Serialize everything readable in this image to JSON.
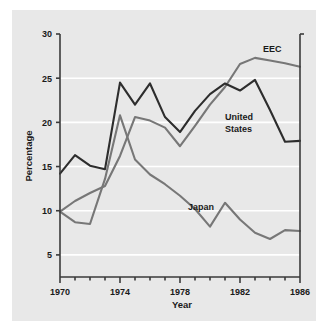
{
  "chart_data": {
    "type": "line",
    "title": "",
    "xlabel": "Year",
    "ylabel": "Percentage",
    "xlim": [
      1970,
      1986
    ],
    "ylim": [
      2.5,
      30
    ],
    "grid": true,
    "grid_values": [
      5,
      10,
      15,
      20,
      25
    ],
    "legend_position": "inline-annotations",
    "x": [
      1970,
      1971,
      1972,
      1973,
      1974,
      1975,
      1976,
      1977,
      1978,
      1979,
      1980,
      1981,
      1982,
      1983,
      1984,
      1985,
      1986
    ],
    "xticks_major": [
      "1970",
      "1974",
      "1978",
      "1982",
      "1986"
    ],
    "xticks_major_values": [
      1970,
      1974,
      1978,
      1982,
      1986
    ],
    "yticks": [
      "5",
      "10",
      "15",
      "20",
      "25",
      "30"
    ],
    "ytick_values": [
      5,
      10,
      15,
      20,
      25,
      30
    ],
    "series": [
      {
        "name": "EEC",
        "color": "#777777",
        "label": "EEC",
        "values": [
          9.9,
          11.1,
          12.0,
          12.8,
          16.2,
          20.6,
          20.2,
          19.4,
          17.3,
          19.6,
          22.0,
          24.0,
          26.6,
          27.3,
          27.0,
          26.7,
          26.3
        ]
      },
      {
        "name": "United States",
        "color": "#2d2d2d",
        "label": "United States",
        "values": [
          14.2,
          16.3,
          15.1,
          14.7,
          24.5,
          22.0,
          24.4,
          20.6,
          18.9,
          21.3,
          23.2,
          24.4,
          23.6,
          24.8,
          21.4,
          17.8,
          17.9
        ]
      },
      {
        "name": "Japan",
        "color": "#777777",
        "label": "Japan",
        "values": [
          9.9,
          8.7,
          8.5,
          13.6,
          20.8,
          15.8,
          14.1,
          13.0,
          11.7,
          10.2,
          8.2,
          10.9,
          9.0,
          7.5,
          6.8,
          7.8,
          7.7
        ]
      }
    ]
  },
  "axis": {
    "ylabel": "Percentage",
    "xlabel": "Year"
  },
  "annotations": {
    "eec": "EEC",
    "united_states_line1": "United",
    "united_states_line2": "States",
    "japan": "Japan"
  },
  "colors": {
    "panel_background": "#e8e8e8",
    "gridline": "#ffffff",
    "axis": "#3a3a3a",
    "dark_series": "#2d2d2d",
    "gray_series": "#777777"
  }
}
